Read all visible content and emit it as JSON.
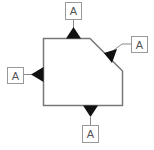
{
  "diagram": {
    "title": "",
    "labels": {
      "top": "A",
      "right": "A",
      "left": "A",
      "bottom": "A"
    },
    "colors": {
      "outline": "#777777",
      "marker": "#111111",
      "box_border": "#999999",
      "text": "#555555"
    }
  }
}
